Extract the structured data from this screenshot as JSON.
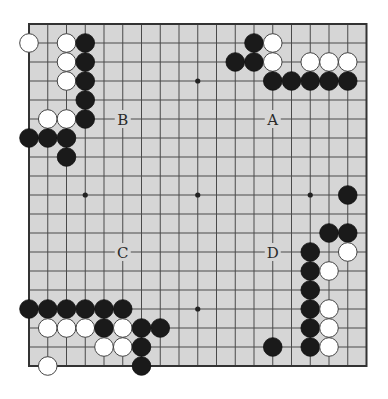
{
  "board": {
    "size": 19,
    "background_color": "#d6d6d6",
    "line_color": "#4a4a4a",
    "black_color": "#1a1a1a",
    "white_color": "#ffffff",
    "star_points": [
      [
        3,
        3
      ],
      [
        9,
        3
      ],
      [
        15,
        3
      ],
      [
        3,
        9
      ],
      [
        9,
        9
      ],
      [
        15,
        9
      ],
      [
        3,
        15
      ],
      [
        9,
        15
      ],
      [
        15,
        15
      ]
    ],
    "stones": [
      {
        "color": "white",
        "col": 0,
        "row": 1
      },
      {
        "color": "white",
        "col": 2,
        "row": 1
      },
      {
        "color": "black",
        "col": 3,
        "row": 1
      },
      {
        "color": "white",
        "col": 2,
        "row": 2
      },
      {
        "color": "black",
        "col": 3,
        "row": 2
      },
      {
        "color": "white",
        "col": 2,
        "row": 3
      },
      {
        "color": "black",
        "col": 3,
        "row": 3
      },
      {
        "color": "black",
        "col": 3,
        "row": 4
      },
      {
        "color": "white",
        "col": 1,
        "row": 5
      },
      {
        "color": "white",
        "col": 2,
        "row": 5
      },
      {
        "color": "black",
        "col": 3,
        "row": 5
      },
      {
        "color": "black",
        "col": 0,
        "row": 6
      },
      {
        "color": "black",
        "col": 1,
        "row": 6
      },
      {
        "color": "black",
        "col": 2,
        "row": 6
      },
      {
        "color": "black",
        "col": 2,
        "row": 7
      },
      {
        "color": "black",
        "col": 12,
        "row": 1
      },
      {
        "color": "white",
        "col": 13,
        "row": 1
      },
      {
        "color": "black",
        "col": 11,
        "row": 2
      },
      {
        "color": "black",
        "col": 12,
        "row": 2
      },
      {
        "color": "white",
        "col": 13,
        "row": 2
      },
      {
        "color": "white",
        "col": 15,
        "row": 2
      },
      {
        "color": "white",
        "col": 16,
        "row": 2
      },
      {
        "color": "white",
        "col": 17,
        "row": 2
      },
      {
        "color": "black",
        "col": 13,
        "row": 3
      },
      {
        "color": "black",
        "col": 14,
        "row": 3
      },
      {
        "color": "black",
        "col": 15,
        "row": 3
      },
      {
        "color": "black",
        "col": 16,
        "row": 3
      },
      {
        "color": "black",
        "col": 17,
        "row": 3
      },
      {
        "color": "black",
        "col": 17,
        "row": 9
      },
      {
        "color": "black",
        "col": 16,
        "row": 11
      },
      {
        "color": "black",
        "col": 17,
        "row": 11
      },
      {
        "color": "black",
        "col": 15,
        "row": 12
      },
      {
        "color": "white",
        "col": 17,
        "row": 12
      },
      {
        "color": "black",
        "col": 15,
        "row": 13
      },
      {
        "color": "white",
        "col": 16,
        "row": 13
      },
      {
        "color": "black",
        "col": 15,
        "row": 14
      },
      {
        "color": "black",
        "col": 15,
        "row": 15
      },
      {
        "color": "white",
        "col": 16,
        "row": 15
      },
      {
        "color": "black",
        "col": 15,
        "row": 16
      },
      {
        "color": "white",
        "col": 16,
        "row": 16
      },
      {
        "color": "black",
        "col": 13,
        "row": 17
      },
      {
        "color": "black",
        "col": 15,
        "row": 17
      },
      {
        "color": "white",
        "col": 16,
        "row": 17
      },
      {
        "color": "black",
        "col": 0,
        "row": 15
      },
      {
        "color": "black",
        "col": 1,
        "row": 15
      },
      {
        "color": "black",
        "col": 2,
        "row": 15
      },
      {
        "color": "black",
        "col": 3,
        "row": 15
      },
      {
        "color": "black",
        "col": 4,
        "row": 15
      },
      {
        "color": "black",
        "col": 5,
        "row": 15
      },
      {
        "color": "white",
        "col": 1,
        "row": 16
      },
      {
        "color": "white",
        "col": 2,
        "row": 16
      },
      {
        "color": "white",
        "col": 3,
        "row": 16
      },
      {
        "color": "black",
        "col": 4,
        "row": 16
      },
      {
        "color": "white",
        "col": 5,
        "row": 16
      },
      {
        "color": "black",
        "col": 6,
        "row": 16
      },
      {
        "color": "black",
        "col": 7,
        "row": 16
      },
      {
        "color": "white",
        "col": 4,
        "row": 17
      },
      {
        "color": "white",
        "col": 5,
        "row": 17
      },
      {
        "color": "black",
        "col": 6,
        "row": 17
      },
      {
        "color": "white",
        "col": 1,
        "row": 18
      },
      {
        "color": "black",
        "col": 6,
        "row": 18
      }
    ],
    "labels": [
      {
        "text": "A",
        "col": 13,
        "row": 5
      },
      {
        "text": "B",
        "col": 5,
        "row": 5
      },
      {
        "text": "C",
        "col": 5,
        "row": 12
      },
      {
        "text": "D",
        "col": 13,
        "row": 12
      }
    ]
  }
}
